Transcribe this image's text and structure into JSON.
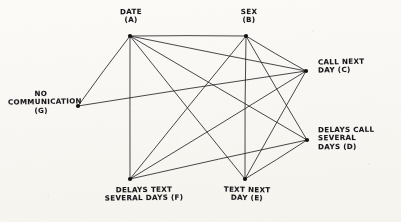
{
  "diagram": {
    "type": "hand-drawn-network-graph",
    "medium": "pen on paper, scanned",
    "ink_color": "#16161a",
    "paper_color": "#fbfaf7",
    "nodes": [
      {
        "id": "A",
        "key": "date",
        "label_lines": [
          "DATE",
          "(A)"
        ],
        "x": 130,
        "y": 36
      },
      {
        "id": "B",
        "key": "sex",
        "label_lines": [
          "SEX",
          "(B)"
        ],
        "x": 246,
        "y": 36
      },
      {
        "id": "C",
        "key": "call-next-day",
        "label_lines": [
          "CALL NEXT",
          "DAY (C)"
        ],
        "x": 306,
        "y": 71
      },
      {
        "id": "D",
        "key": "delays-call",
        "label_lines": [
          "DELAYS CALL",
          "SEVERAL",
          "DAYS (D)"
        ],
        "x": 307,
        "y": 140
      },
      {
        "id": "E",
        "key": "text-next-day",
        "label_lines": [
          "TEXT NEXT",
          "DAY (E)"
        ],
        "x": 245,
        "y": 179
      },
      {
        "id": "F",
        "key": "delays-text",
        "label_lines": [
          "DELAYS TEXT",
          "SEVERAL DAYS (F)"
        ],
        "x": 130,
        "y": 179
      },
      {
        "id": "G",
        "key": "no-communication",
        "label_lines": [
          "NO",
          "COMMUNICATION",
          "(G)"
        ],
        "x": 78,
        "y": 106
      }
    ],
    "edges": [
      {
        "from": "A",
        "to": "B"
      },
      {
        "from": "A",
        "to": "C"
      },
      {
        "from": "A",
        "to": "D"
      },
      {
        "from": "A",
        "to": "E"
      },
      {
        "from": "A",
        "to": "F"
      },
      {
        "from": "A",
        "to": "G"
      },
      {
        "from": "B",
        "to": "C"
      },
      {
        "from": "B",
        "to": "D"
      },
      {
        "from": "B",
        "to": "E"
      },
      {
        "from": "B",
        "to": "F"
      },
      {
        "from": "C",
        "to": "E"
      },
      {
        "from": "C",
        "to": "F"
      },
      {
        "from": "C",
        "to": "G"
      },
      {
        "from": "D",
        "to": "E"
      },
      {
        "from": "D",
        "to": "F"
      }
    ]
  }
}
